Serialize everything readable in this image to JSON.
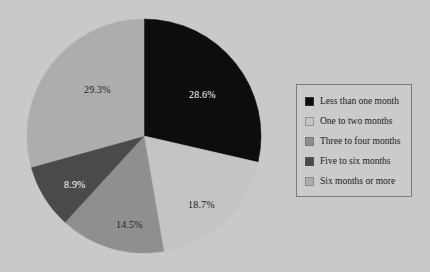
{
  "background_color": "#c9c9c9",
  "chart_data": {
    "type": "pie",
    "title": "",
    "subtitle": "",
    "xlabel": "",
    "ylabel": "",
    "grid": false,
    "legend_position": "right",
    "start_angle_deg": 0,
    "direction": "clockwise",
    "categories": [
      "Less than one month",
      "One to two months",
      "Three to four months",
      "Five to six months",
      "Six months or more"
    ],
    "values": [
      28.6,
      18.7,
      14.5,
      8.9,
      29.3
    ],
    "value_unit": "%",
    "data_labels": [
      "28.6%",
      "18.7%",
      "14.5%",
      "8.9%",
      "29.3%"
    ],
    "slice_colors": [
      "#0d0d0d",
      "#c4c4c4",
      "#8f8f8f",
      "#4a4a4a",
      "#adadad"
    ],
    "data_label_colors": [
      "#ffffff",
      "#1a1a1a",
      "#1f1f1f",
      "#ffffff",
      "#1f1f1f"
    ]
  },
  "pie": {
    "center_x": 118,
    "center_y": 118,
    "radius": 117,
    "slices": [
      {
        "name": "less-than-one-month",
        "label": "28.6%",
        "value": 28.6,
        "color": "#0d0d0d",
        "label_color": "#ffffff",
        "label_x": 163,
        "label_y": 80
      },
      {
        "name": "one-to-two-months",
        "label": "18.7%",
        "value": 18.7,
        "color": "#c4c4c4",
        "label_color": "#1a1a1a",
        "label_y": 190,
        "label_x": 162
      },
      {
        "name": "three-to-four-months",
        "label": "14.5%",
        "value": 14.5,
        "color": "#8f8f8f",
        "label_color": "#1f1f1f",
        "label_x": 90,
        "label_y": 210
      },
      {
        "name": "five-to-six-months",
        "label": "8.9%",
        "value": 8.9,
        "color": "#4a4a4a",
        "label_color": "#ffffff",
        "label_x": 38,
        "label_y": 170
      },
      {
        "name": "six-months-or-more",
        "label": "29.3%",
        "value": 29.3,
        "color": "#adadad",
        "label_color": "#1f1f1f",
        "label_x": 58,
        "label_y": 75
      }
    ]
  },
  "legend": {
    "border_color": "#7d7d7d",
    "background_color": "#cbcbcb",
    "items": [
      {
        "label": "Less than one month",
        "color": "#0d0d0d"
      },
      {
        "label": "One to two months",
        "color": "#c4c4c4"
      },
      {
        "label": "Three to four months",
        "color": "#8f8f8f"
      },
      {
        "label": "Five to six months",
        "color": "#4a4a4a"
      },
      {
        "label": "Six months or more",
        "color": "#adadad"
      }
    ]
  }
}
